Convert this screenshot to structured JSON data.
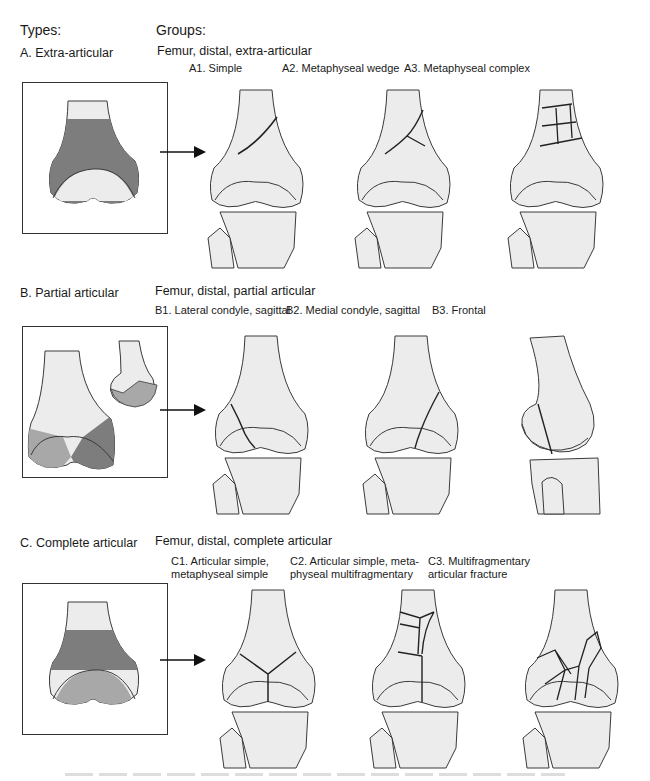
{
  "headers": {
    "types": "Types:",
    "groups": "Groups:"
  },
  "colors": {
    "bone_fill": "#ececec",
    "bone_outline": "#3a3a3a",
    "highlight": "#7d7d7d",
    "highlight_light": "#a8a8a8",
    "frame": "#333333"
  },
  "rows": [
    {
      "type_label": "A. Extra-articular",
      "group_title": "Femur, distal, extra-articular",
      "groups": [
        {
          "label": "A1. Simple",
          "label2": ""
        },
        {
          "label": "A2. Metaphyseal wedge",
          "label2": ""
        },
        {
          "label": "A3. Metaphyseal complex",
          "label2": ""
        }
      ]
    },
    {
      "type_label": "B. Partial articular",
      "group_title": "Femur, distal, partial articular",
      "groups": [
        {
          "label": "B1. Lateral condyle, sagittal",
          "label2": ""
        },
        {
          "label": "B2. Medial condyle, sagittal",
          "label2": ""
        },
        {
          "label": "B3. Frontal",
          "label2": ""
        }
      ]
    },
    {
      "type_label": "C. Complete articular",
      "group_title": "Femur, distal, complete articular",
      "groups": [
        {
          "label": "C1. Articular simple,",
          "label2": "metaphyseal simple"
        },
        {
          "label": "C2. Articular simple, meta-",
          "label2": "physeal multifragmentary"
        },
        {
          "label": "C3. Multifragmentary",
          "label2": "articular fracture"
        }
      ]
    }
  ]
}
